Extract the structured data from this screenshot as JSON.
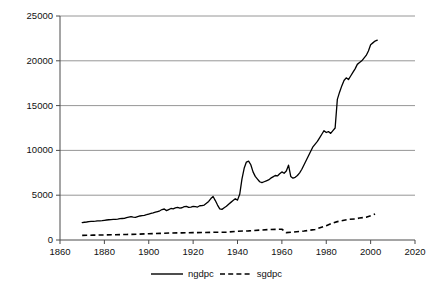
{
  "chart_data": {
    "type": "line",
    "title": "",
    "xlabel": "",
    "ylabel": "",
    "xlim": [
      1860,
      2020
    ],
    "ylim": [
      0,
      25000
    ],
    "xticks": [
      1860,
      1880,
      1900,
      1920,
      1940,
      1960,
      1980,
      2000,
      2020
    ],
    "yticks": [
      0,
      5000,
      10000,
      15000,
      20000,
      25000
    ],
    "grid": "horizontal",
    "legend_position": "bottom-center",
    "series": [
      {
        "name": "ngdpc",
        "style": "solid",
        "color": "#000000",
        "x": [
          1870,
          1871,
          1872,
          1873,
          1874,
          1875,
          1876,
          1877,
          1878,
          1879,
          1880,
          1881,
          1882,
          1883,
          1884,
          1885,
          1886,
          1887,
          1888,
          1889,
          1890,
          1891,
          1892,
          1893,
          1894,
          1895,
          1896,
          1897,
          1898,
          1899,
          1900,
          1901,
          1902,
          1903,
          1904,
          1905,
          1906,
          1907,
          1908,
          1909,
          1910,
          1911,
          1912,
          1913,
          1914,
          1915,
          1916,
          1917,
          1918,
          1919,
          1920,
          1921,
          1922,
          1923,
          1924,
          1925,
          1926,
          1927,
          1928,
          1929,
          1930,
          1931,
          1932,
          1933,
          1934,
          1935,
          1936,
          1937,
          1938,
          1939,
          1940,
          1941,
          1942,
          1943,
          1944,
          1945,
          1946,
          1947,
          1948,
          1949,
          1950,
          1951,
          1952,
          1953,
          1954,
          1955,
          1956,
          1957,
          1958,
          1959,
          1960,
          1961,
          1962,
          1963,
          1964,
          1965,
          1966,
          1967,
          1968,
          1969,
          1970,
          1971,
          1972,
          1973,
          1974,
          1975,
          1976,
          1977,
          1978,
          1979,
          1980,
          1981,
          1982,
          1983,
          1984,
          1985,
          1986,
          1987,
          1988,
          1989,
          1990,
          1991,
          1992,
          1993,
          1994,
          1995,
          1996,
          1997,
          1998,
          1999,
          2000,
          2001,
          2002,
          2003
        ],
        "values": [
          1950,
          1980,
          2010,
          2060,
          2080,
          2080,
          2100,
          2130,
          2140,
          2160,
          2200,
          2230,
          2260,
          2280,
          2300,
          2300,
          2330,
          2380,
          2400,
          2420,
          2500,
          2560,
          2620,
          2560,
          2520,
          2600,
          2680,
          2720,
          2760,
          2820,
          2900,
          2960,
          3020,
          3100,
          3180,
          3260,
          3400,
          3460,
          3280,
          3400,
          3520,
          3480,
          3580,
          3640,
          3560,
          3600,
          3720,
          3760,
          3640,
          3680,
          3760,
          3720,
          3680,
          3820,
          3840,
          3900,
          4100,
          4300,
          4620,
          4850,
          4400,
          3900,
          3480,
          3420,
          3600,
          3760,
          4000,
          4200,
          4400,
          4600,
          4450,
          5100,
          6800,
          8000,
          8700,
          8800,
          8400,
          7600,
          7100,
          6800,
          6500,
          6400,
          6500,
          6600,
          6700,
          6900,
          7050,
          7200,
          7150,
          7400,
          7600,
          7450,
          7700,
          8350,
          7100,
          6900,
          7000,
          7200,
          7500,
          7900,
          8400,
          8900,
          9400,
          9900,
          10400,
          10700,
          11000,
          11400,
          11800,
          12200,
          12000,
          12100,
          11900,
          12200,
          12500,
          15700,
          16500,
          17200,
          17800,
          18100,
          17900,
          18300,
          18700,
          19100,
          19600,
          19800,
          20000,
          20300,
          20600,
          21100,
          21800,
          22000,
          22200,
          22300
        ]
      },
      {
        "name": "sgdpc",
        "style": "dashed",
        "color": "#000000",
        "x": [
          1870,
          1875,
          1880,
          1885,
          1890,
          1895,
          1900,
          1905,
          1910,
          1915,
          1920,
          1925,
          1930,
          1935,
          1940,
          1945,
          1950,
          1955,
          1960,
          1962,
          1965,
          1970,
          1975,
          1980,
          1983,
          1985,
          1988,
          1990,
          1993,
          1995,
          1998,
          2000,
          2002
        ],
        "values": [
          520,
          540,
          560,
          590,
          620,
          650,
          700,
          740,
          780,
          800,
          820,
          840,
          860,
          880,
          980,
          1020,
          1100,
          1180,
          1200,
          820,
          880,
          1000,
          1180,
          1600,
          1900,
          2050,
          2200,
          2300,
          2350,
          2450,
          2550,
          2700,
          2900
        ]
      }
    ],
    "legend": [
      {
        "label": "ngdpc",
        "style": "solid"
      },
      {
        "label": "sgdpc",
        "style": "dashed"
      }
    ]
  }
}
